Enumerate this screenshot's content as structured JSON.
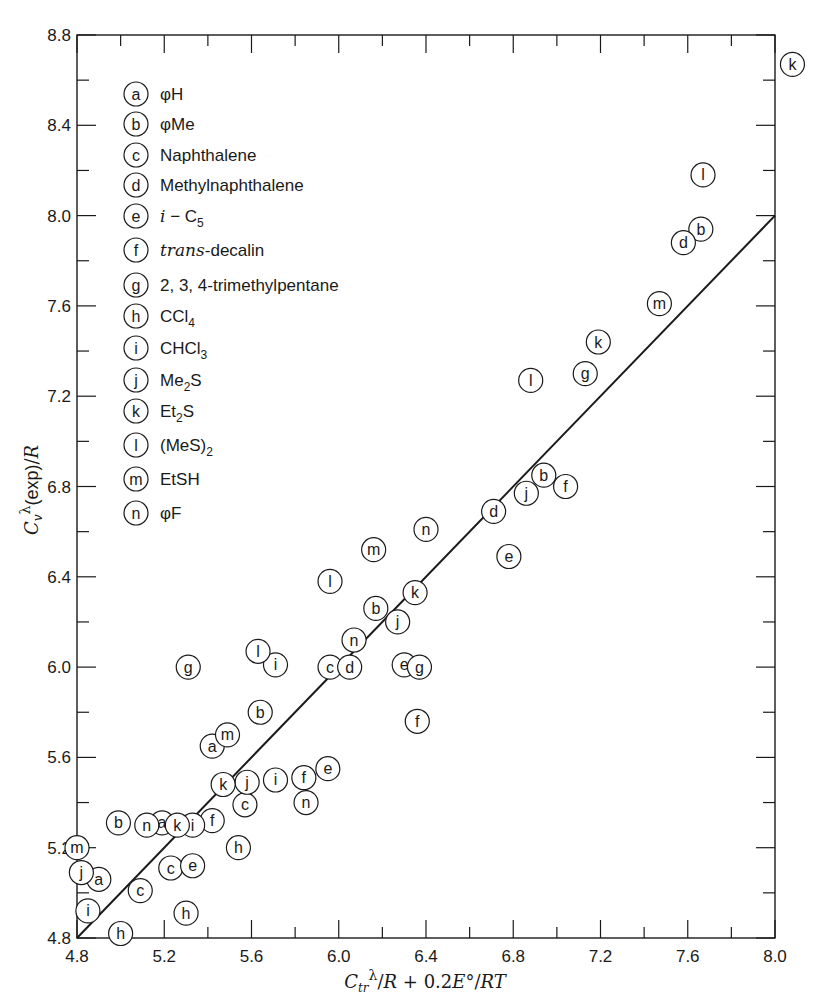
{
  "chart_data": {
    "type": "scatter",
    "title": "",
    "xlabel": "Ctr^λ/R + 0.2E°/RT",
    "ylabel": "Cv^λ(exp)/R",
    "xlim": [
      4.8,
      8.0
    ],
    "ylim": [
      4.8,
      8.8
    ],
    "x_ticks": [
      "4.8",
      "5.2",
      "5.6",
      "6.0",
      "6.4",
      "6.8",
      "7.2",
      "7.6",
      "8.0"
    ],
    "y_ticks": [
      "4.8",
      "5.2",
      "5.6",
      "6.0",
      "6.4",
      "6.8",
      "7.2",
      "7.6",
      "8.0",
      "8.4",
      "8.8"
    ],
    "grid": false,
    "legend_position": "upper-left inside",
    "reference_line": {
      "label": "y = x",
      "from": [
        4.8,
        4.8
      ],
      "to": [
        8.0,
        8.0
      ]
    },
    "legend": [
      {
        "key": "a",
        "label": "φH"
      },
      {
        "key": "b",
        "label": "φMe"
      },
      {
        "key": "c",
        "label": "Naphthalene"
      },
      {
        "key": "d",
        "label": "Methylnaphthalene"
      },
      {
        "key": "e",
        "label": "i−C5"
      },
      {
        "key": "f",
        "label": "trans-decalin"
      },
      {
        "key": "g",
        "label": "2, 3, 4-trimethylpentane"
      },
      {
        "key": "h",
        "label": "CCl4"
      },
      {
        "key": "i",
        "label": "CHCl3"
      },
      {
        "key": "j",
        "label": "Me2S"
      },
      {
        "key": "k",
        "label": "Et2S"
      },
      {
        "key": "l",
        "label": "(MeS)2"
      },
      {
        "key": "m",
        "label": "EtSH"
      },
      {
        "key": "n",
        "label": "φF"
      }
    ],
    "series": [
      {
        "name": "a",
        "points": [
          [
            4.9,
            5.06
          ],
          [
            5.19,
            5.31
          ],
          [
            5.42,
            5.65
          ]
        ]
      },
      {
        "name": "b",
        "points": [
          [
            4.99,
            5.31
          ],
          [
            5.64,
            5.8
          ],
          [
            6.17,
            6.26
          ],
          [
            6.94,
            6.85
          ],
          [
            7.66,
            7.94
          ]
        ]
      },
      {
        "name": "c",
        "points": [
          [
            5.09,
            5.01
          ],
          [
            5.23,
            5.11
          ],
          [
            5.57,
            5.39
          ],
          [
            5.96,
            6.0
          ]
        ]
      },
      {
        "name": "d",
        "points": [
          [
            6.05,
            6.0
          ],
          [
            6.71,
            6.69
          ],
          [
            7.58,
            7.88
          ]
        ]
      },
      {
        "name": "e",
        "points": [
          [
            5.33,
            5.12
          ],
          [
            5.95,
            5.55
          ],
          [
            6.3,
            6.01
          ],
          [
            6.78,
            6.49
          ]
        ]
      },
      {
        "name": "f",
        "points": [
          [
            5.42,
            5.32
          ],
          [
            5.84,
            5.51
          ],
          [
            6.36,
            5.76
          ],
          [
            7.04,
            6.8
          ]
        ]
      },
      {
        "name": "g",
        "points": [
          [
            5.31,
            6.0
          ],
          [
            6.37,
            6.0
          ],
          [
            7.13,
            7.3
          ]
        ]
      },
      {
        "name": "h",
        "points": [
          [
            5.0,
            4.82
          ],
          [
            5.3,
            4.91
          ],
          [
            5.54,
            5.2
          ]
        ]
      },
      {
        "name": "i",
        "points": [
          [
            4.85,
            4.92
          ],
          [
            5.33,
            5.3
          ],
          [
            5.71,
            5.5
          ],
          [
            5.71,
            6.01
          ]
        ]
      },
      {
        "name": "j",
        "points": [
          [
            4.82,
            5.09
          ],
          [
            5.58,
            5.49
          ],
          [
            6.27,
            6.2
          ],
          [
            6.86,
            6.77
          ]
        ]
      },
      {
        "name": "k",
        "points": [
          [
            5.26,
            5.3
          ],
          [
            5.47,
            5.48
          ],
          [
            6.35,
            6.33
          ],
          [
            7.19,
            7.44
          ],
          [
            8.08,
            8.67
          ]
        ]
      },
      {
        "name": "l",
        "points": [
          [
            5.63,
            6.07
          ],
          [
            5.96,
            6.38
          ],
          [
            6.88,
            7.27
          ],
          [
            7.67,
            8.18
          ]
        ]
      },
      {
        "name": "m",
        "points": [
          [
            4.8,
            5.2
          ],
          [
            5.49,
            5.7
          ],
          [
            6.16,
            6.52
          ],
          [
            7.47,
            7.61
          ]
        ]
      },
      {
        "name": "n",
        "points": [
          [
            5.12,
            5.3
          ],
          [
            5.85,
            5.4
          ],
          [
            6.07,
            6.12
          ],
          [
            6.4,
            6.61
          ]
        ]
      }
    ]
  },
  "axes": {
    "x_title_parts": {
      "c": "C",
      "sub": "tr",
      "sup": "λ",
      "rest1": "/",
      "R": "R",
      "plus": " + 0.2",
      "E": "E",
      "deg": "°",
      "slash": "/",
      "RT": "RT"
    },
    "y_title_parts": {
      "c": "C",
      "sub": "v",
      "sup": "λ",
      "exp": "(exp)",
      "slash": "/",
      "R": "R"
    }
  },
  "colors": {
    "ink": "#1a1a1a",
    "background": "#ffffff"
  }
}
